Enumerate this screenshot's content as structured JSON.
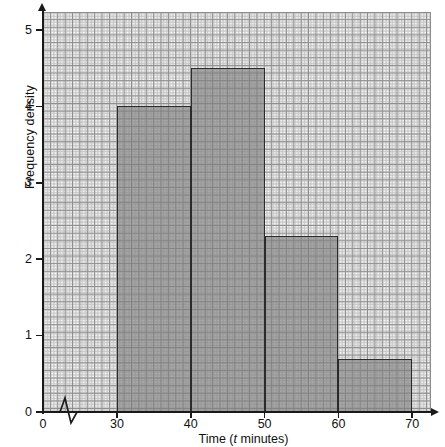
{
  "figure": {
    "kind": "histogram",
    "background": "#ffffff",
    "grid": {
      "visible": true,
      "major_color": "#8d8d8d",
      "minor_color": "#c9c9c9"
    },
    "axis_color": "#1a1a1a",
    "bar_fill": "#9a9a9a",
    "bar_edge": "#2b2b2b",
    "axis_break_symbol": "zigzag"
  },
  "axes": {
    "y": {
      "title": "Frequency density",
      "ticks": [
        "0",
        "1",
        "2",
        "3",
        "4",
        "5"
      ],
      "min": 0,
      "max": 5.25
    },
    "x": {
      "title_prefix": "Time (",
      "title_italic": "t",
      "title_suffix": " minutes)",
      "ticks": [
        "0",
        "30",
        "40",
        "50",
        "60",
        "70"
      ],
      "min": 0,
      "max": 71
    }
  },
  "chart_data": {
    "type": "bar",
    "title": "",
    "xlabel": "Time (t minutes)",
    "ylabel": "Frequency density",
    "xlim": [
      0,
      71
    ],
    "ylim": [
      0,
      5.25
    ],
    "grid": true,
    "legend": "none",
    "axis_break_x": "between 0 and 30",
    "categories": [
      "30-40",
      "40-50",
      "50-60",
      "60-70"
    ],
    "values": [
      4.0,
      4.5,
      2.3,
      0.7
    ],
    "bins": [
      {
        "label": "30-40",
        "lower": 30,
        "upper": 40,
        "width": 10,
        "frequency_density": 4.0,
        "frequency": 40
      },
      {
        "label": "40-50",
        "lower": 40,
        "upper": 50,
        "width": 10,
        "frequency_density": 4.5,
        "frequency": 45
      },
      {
        "label": "50-60",
        "lower": 50,
        "upper": 60,
        "width": 10,
        "frequency_density": 2.3,
        "frequency": 23
      },
      {
        "label": "60-70",
        "lower": 60,
        "upper": 70,
        "width": 10,
        "frequency_density": 0.7,
        "frequency": 7
      }
    ],
    "xtick_values": [
      0,
      30,
      40,
      50,
      60,
      70
    ],
    "ytick_values": [
      0,
      1,
      2,
      3,
      4,
      5
    ]
  }
}
